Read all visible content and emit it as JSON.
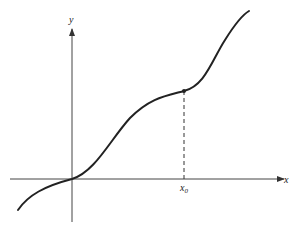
{
  "figure": {
    "axes": {
      "x_label": "x",
      "y_label": "y",
      "x_axis": {
        "from": [
          10,
          179
        ],
        "to": [
          286,
          179
        ]
      },
      "y_axis": {
        "from": [
          72,
          222
        ],
        "to": [
          72,
          27
        ]
      }
    },
    "marker": {
      "label": "x",
      "subscript": "0",
      "point": [
        184,
        91
      ],
      "foot": [
        184,
        179
      ]
    },
    "curve": {
      "description": "increasing curve through origin with an inflection/plateau before x0",
      "points": [
        [
          18,
          210
        ],
        [
          72,
          179
        ],
        [
          150,
          100
        ],
        [
          184,
          91
        ],
        [
          249,
          11
        ]
      ]
    },
    "colors": {
      "ink": "#222222",
      "axis": "#444444",
      "background": "#ffffff"
    }
  }
}
